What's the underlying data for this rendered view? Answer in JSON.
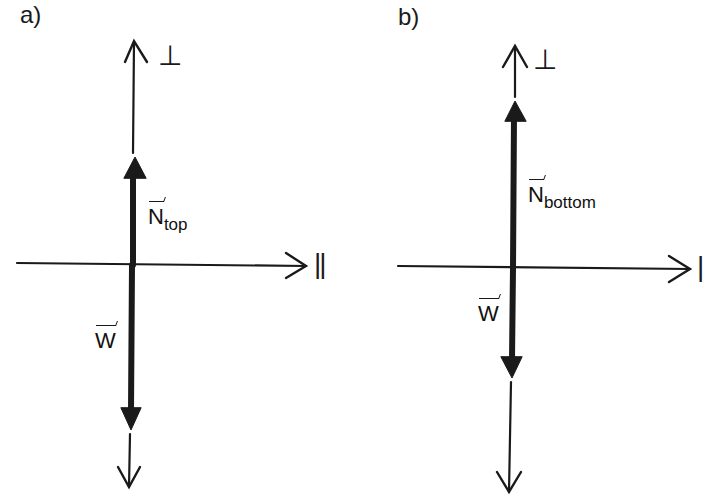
{
  "panels": [
    {
      "id": "a",
      "label": "a)",
      "perp_axis_label": "⊥",
      "parallel_axis_label": "||",
      "vectors": [
        {
          "name": "N",
          "subscript": "top",
          "direction": "up",
          "label": "N_top"
        },
        {
          "name": "W",
          "subscript": "",
          "direction": "down",
          "label": "W"
        }
      ]
    },
    {
      "id": "b",
      "label": "b)",
      "perp_axis_label": "⊥",
      "parallel_axis_label": "|",
      "vectors": [
        {
          "name": "N",
          "subscript": "bottom",
          "direction": "up",
          "label": "N_bottom"
        },
        {
          "name": "W",
          "subscript": "",
          "direction": "down",
          "label": "W"
        }
      ]
    }
  ],
  "colors": {
    "ink": "#1a1a1a",
    "background": "#ffffff"
  }
}
